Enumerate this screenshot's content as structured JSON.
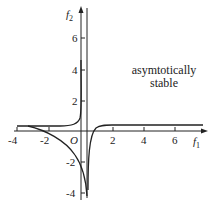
{
  "diagram": {
    "type": "phase-plane curves",
    "annotation": {
      "line1": "asymtotically",
      "line2": "stable"
    },
    "axes": {
      "x_label": "f",
      "x_label_sub": "1",
      "y_label": "f",
      "y_label_sub": "2",
      "origin_label": "O",
      "x_ticks": [
        "-4",
        "-2",
        "2",
        "4",
        "6"
      ],
      "y_ticks": [
        "6",
        "4",
        "2",
        "-2",
        "-4"
      ]
    },
    "colors": {
      "stroke": "#222222",
      "text": "#222222",
      "background": "#ffffff"
    }
  }
}
